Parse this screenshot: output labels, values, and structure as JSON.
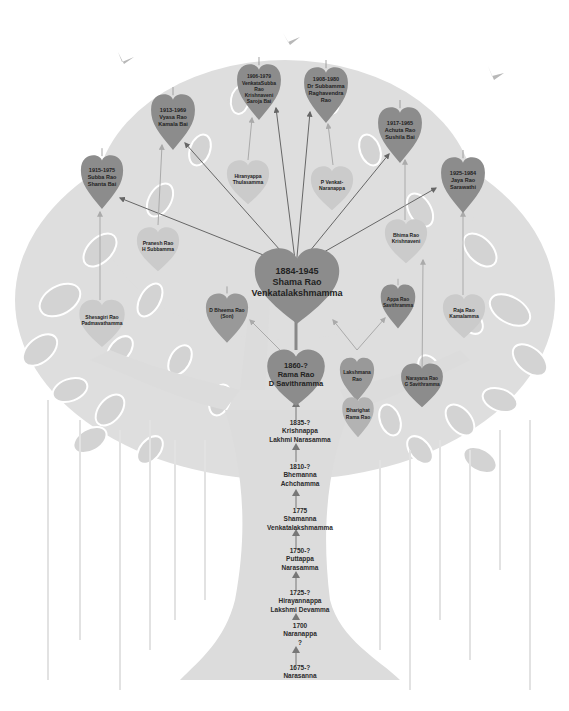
{
  "colors": {
    "background": "#ffffff",
    "tree": "#dcdcdc",
    "leaf_dark": "#8c8c8c",
    "leaf_light": "#c9c9c9",
    "arrow": "#666666",
    "bird": "#b8b8b8"
  },
  "main": {
    "id": "shama-rao",
    "lines": [
      "1884-1945",
      "Shama Rao",
      "Venkatalakshmamma"
    ]
  },
  "father": {
    "id": "rama-rao",
    "lines": [
      "1860-?",
      "Rama Rao",
      "D Savithramma"
    ]
  },
  "children": [
    {
      "id": "subba-rao",
      "lines": [
        "1915-1975",
        "Subba Rao",
        "Shanta Bai"
      ]
    },
    {
      "id": "vyasa-rao",
      "lines": [
        "1913-1969",
        "Vyasa Rao",
        "Kamala Bai"
      ]
    },
    {
      "id": "venkatasubba-rao",
      "lines": [
        "1906-1979",
        "VenkataSubba",
        "Rao",
        "Krishnaveni",
        "Saroja Bai"
      ]
    },
    {
      "id": "subbamma",
      "lines": [
        "1908-1980",
        "Dr Subbamma",
        "Raghavendra",
        "Rao"
      ]
    },
    {
      "id": "achuta-rao",
      "lines": [
        "1917-1965",
        "Achuta Rao",
        "Sushila Bai"
      ]
    },
    {
      "id": "jaya-rao",
      "lines": [
        "1925-1984",
        "Jaya Rao",
        "Sarawathi"
      ]
    }
  ],
  "spouse_families": [
    {
      "id": "sheshagiri-rao",
      "lines": [
        "Shesagiri Rao",
        "Padmavathamma"
      ]
    },
    {
      "id": "pranesh-rao",
      "lines": [
        "Pranesh Rao",
        "H Subbamma"
      ]
    },
    {
      "id": "hiranyappa",
      "lines": [
        "Hiranyappa",
        "Thulasamma"
      ]
    },
    {
      "id": "p-venkat",
      "lines": [
        "P Venkat-",
        "Naranappa"
      ]
    },
    {
      "id": "bhima-rao",
      "lines": [
        "Bhima Rao",
        "Krishnaveni"
      ]
    },
    {
      "id": "raja-rao",
      "lines": [
        "Raja Rao",
        "Kamalamma"
      ]
    }
  ],
  "siblings": [
    {
      "id": "bheema-rao",
      "lines": [
        "D Bheema Rao",
        "(Son)"
      ]
    },
    {
      "id": "appa-rao",
      "lines": [
        "Appa Rao",
        "Savithramma"
      ]
    },
    {
      "id": "lakshmana-rao",
      "lines": [
        "Lakshmana",
        "Rao"
      ]
    },
    {
      "id": "bharighat-rama-rao",
      "lines": [
        "Bharighat",
        "Rama Rao"
      ]
    },
    {
      "id": "narayana-rao",
      "lines": [
        "Narayana Rao",
        "G Savithramma"
      ]
    }
  ],
  "trunk": [
    {
      "id": "krishnappa",
      "lines": [
        "1835-?",
        "Krishnappa",
        "Lakhmi Narasamma"
      ]
    },
    {
      "id": "bhemanna",
      "lines": [
        "1810-?",
        "Bhemanna",
        "Achchamma"
      ]
    },
    {
      "id": "shamanna",
      "lines": [
        "1775",
        "Shamanna",
        "Venkatalakshmamma"
      ]
    },
    {
      "id": "puttappa",
      "lines": [
        "1750-?",
        "Puttappa",
        "Narasamma"
      ]
    },
    {
      "id": "hirayannappa",
      "lines": [
        "1725-?",
        "Hirayannappa",
        "Lakshmi Devamma"
      ]
    },
    {
      "id": "naranappa",
      "lines": [
        "1700",
        "Naranappa",
        "?"
      ]
    },
    {
      "id": "narasanna",
      "lines": [
        "1675-?",
        "Narasanna"
      ]
    }
  ]
}
